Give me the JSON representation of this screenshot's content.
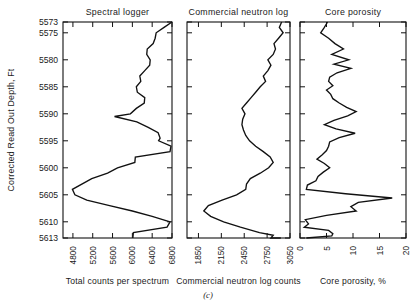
{
  "figure": {
    "caption": "(c)",
    "y_axis_label": "Corrected Read Out Depth, Ft",
    "depth_ticks": [
      "5573",
      "5575",
      "5580",
      "5585",
      "5590",
      "5595",
      "5600",
      "5605",
      "5610",
      "5613"
    ],
    "depth_min": 5573,
    "depth_max": 5613
  },
  "chart_data": [
    {
      "type": "line",
      "title": "Spectral logger",
      "xlabel": "Total counts per spectrum",
      "ylabel": "Corrected Read Out Depth, Ft",
      "xlim": [
        4600,
        6800
      ],
      "ylim": [
        5613,
        5573
      ],
      "xticks": [
        4800,
        5200,
        5600,
        6000,
        6400,
        6800
      ],
      "yticks": [
        5573,
        5575,
        5580,
        5585,
        5590,
        5595,
        5600,
        5605,
        5610,
        5613
      ],
      "grid": false,
      "legend": "none",
      "x": [
        6800,
        6640,
        6480,
        6460,
        6420,
        6300,
        6290,
        6360,
        6350,
        6250,
        6150,
        6170,
        6080,
        6100,
        6250,
        6240,
        6080,
        5960,
        5640,
        6090,
        6320,
        6520,
        6560,
        6530,
        6780,
        6760,
        6060,
        6050,
        5700,
        5500,
        5180,
        4790,
        4840,
        5080,
        5540,
        6000,
        6400,
        6760,
        6700,
        6020,
        6010
      ],
      "y": [
        5573,
        5574,
        5575,
        5576,
        5577,
        5578,
        5579,
        5580,
        5581,
        5582,
        5583,
        5584,
        5585,
        5586,
        5587,
        5588,
        5589,
        5590,
        5590.5,
        5591.5,
        5592.5,
        5593.5,
        5594.5,
        5595,
        5596,
        5597,
        5598,
        5599,
        5600,
        5601,
        5602,
        5604,
        5605,
        5606,
        5607,
        5608,
        5609,
        5610,
        5611,
        5612,
        5613
      ]
    },
    {
      "type": "line",
      "title": "Commercial neutron log",
      "xlabel": "Commercial neutron log counts",
      "ylabel": "Corrected Read Out Depth, Ft",
      "xlim": [
        1700,
        3050
      ],
      "ylim": [
        5613,
        5573
      ],
      "xticks": [
        1850,
        2150,
        2450,
        2750,
        3050
      ],
      "yticks": [
        5573,
        5575,
        5580,
        5585,
        5590,
        5595,
        5600,
        5605,
        5610,
        5613
      ],
      "grid": false,
      "legend": "none",
      "x": [
        2940,
        2910,
        2960,
        2900,
        2840,
        2860,
        2830,
        2760,
        2800,
        2760,
        2700,
        2730,
        2660,
        2600,
        2540,
        2480,
        2420,
        2460,
        2430,
        2420,
        2440,
        2470,
        2520,
        2600,
        2700,
        2790,
        2830,
        2770,
        2660,
        2530,
        2480,
        2470,
        2350,
        2160,
        1980,
        1920,
        2010,
        2180,
        2400,
        2650,
        2830,
        2800,
        2840,
        2930
      ],
      "y": [
        5573,
        5574,
        5575,
        5576,
        5577,
        5578,
        5579,
        5580,
        5581,
        5582,
        5583,
        5584,
        5585,
        5586,
        5587,
        5588,
        5589,
        5590,
        5591,
        5592,
        5593,
        5594,
        5595,
        5596,
        5597,
        5598,
        5599,
        5600,
        5601,
        5602,
        5603,
        5604,
        5605,
        5606,
        5607,
        5608,
        5609,
        5610,
        5611,
        5612,
        5612.5,
        5613,
        5613,
        5613
      ]
    },
    {
      "type": "line",
      "title": "Core porosity",
      "xlabel": "Core porosity, %",
      "ylabel": "Corrected Read Out Depth, Ft",
      "xlim": [
        0,
        20
      ],
      "ylim": [
        5613,
        5573
      ],
      "xticks": [
        0,
        5,
        10,
        15,
        20
      ],
      "yticks": [
        5573,
        5575,
        5580,
        5585,
        5590,
        5595,
        5600,
        5605,
        5610,
        5613
      ],
      "grid": false,
      "legend": "none",
      "x": [
        5.2,
        4.6,
        3.9,
        5.4,
        6.6,
        8.2,
        6.0,
        9.2,
        6.4,
        9.6,
        7.0,
        5.6,
        5.4,
        6.2,
        5.0,
        5.8,
        6.2,
        7.4,
        8.8,
        10.6,
        9.0,
        6.4,
        4.6,
        6.8,
        10.4,
        7.4,
        5.6,
        5.4,
        5.0,
        4.2,
        3.2,
        4.6,
        5.6,
        4.4,
        3.4,
        3.0,
        1.4,
        1.2,
        8.6,
        17.4,
        11.0,
        9.6,
        10.6,
        5.0,
        1.0,
        1.6,
        0.8,
        5.4,
        6.2,
        6.0,
        1.2
      ],
      "y": [
        5573,
        5574,
        5575,
        5576,
        5577,
        5578,
        5579,
        5580,
        5580.8,
        5581.6,
        5582.4,
        5583.2,
        5584,
        5584.8,
        5585.6,
        5586.4,
        5587.2,
        5588,
        5588.8,
        5589.6,
        5590.4,
        5591.2,
        5592,
        5592.8,
        5593.6,
        5594.4,
        5595.2,
        5596,
        5596.8,
        5597.6,
        5598.4,
        5599.2,
        5600,
        5600.8,
        5601.6,
        5602.4,
        5603.2,
        5604,
        5604.8,
        5605.6,
        5606.4,
        5607.2,
        5608,
        5608.8,
        5609.6,
        5610.4,
        5611,
        5611.6,
        5612.2,
        5612.6,
        5613
      ]
    }
  ]
}
